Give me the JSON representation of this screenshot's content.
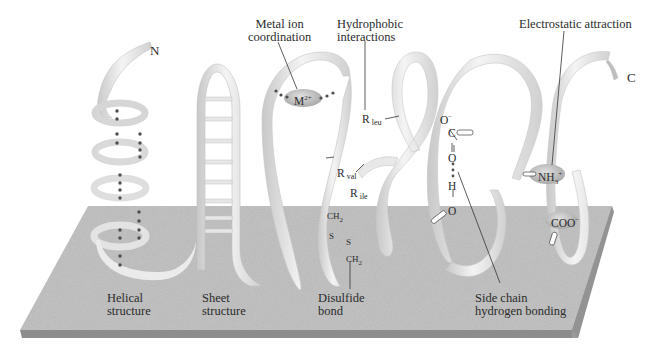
{
  "figure": {
    "termini": {
      "n": "N",
      "c": "C"
    },
    "labels": {
      "metal_ion": "Metal ion\ncoordination",
      "hydrophobic": "Hydrophobic\ninteractions",
      "electrostatic": "Electrostatic attraction",
      "helical": "Helical\nstructure",
      "sheet": "Sheet\nstructure",
      "disulfide": "Disulfide\nbond",
      "side_chain_hb": "Side chain\nhydrogen bonding"
    },
    "chemistry": {
      "metal": "M",
      "metal_charge": "2+",
      "r_leu_base": "R",
      "r_leu_sub": "leu",
      "r_val_base": "R",
      "r_val_sub": "val",
      "r_ile_base": "R",
      "r_ile_sub": "ile",
      "ch2_top": "CH",
      "ch2_top_sub": "2",
      "s_left": "S",
      "s_right": "S",
      "ch2_bottom": "CH",
      "ch2_bottom_sub": "2",
      "o_minus": "O",
      "o_minus_charge": "−",
      "carbon": "C",
      "oxygen_dbl": "O",
      "hydrogen": "H",
      "oxygen_hydroxyl": "O",
      "ammonium": "NH",
      "ammonium_sub": "3",
      "ammonium_charge": "+",
      "carboxylate": "COO",
      "carboxylate_charge": "−"
    },
    "colors": {
      "platform_top": "#c4c4c4",
      "platform_edge": "#8e8e8e",
      "ribbon_light": "#f2f2f2",
      "ribbon_mid": "#dcdcdc",
      "ribbon_dark": "#bdbdbd",
      "dot": "#555555",
      "ion_blob": "#bdbdbd",
      "leader_line": "#333333"
    }
  }
}
